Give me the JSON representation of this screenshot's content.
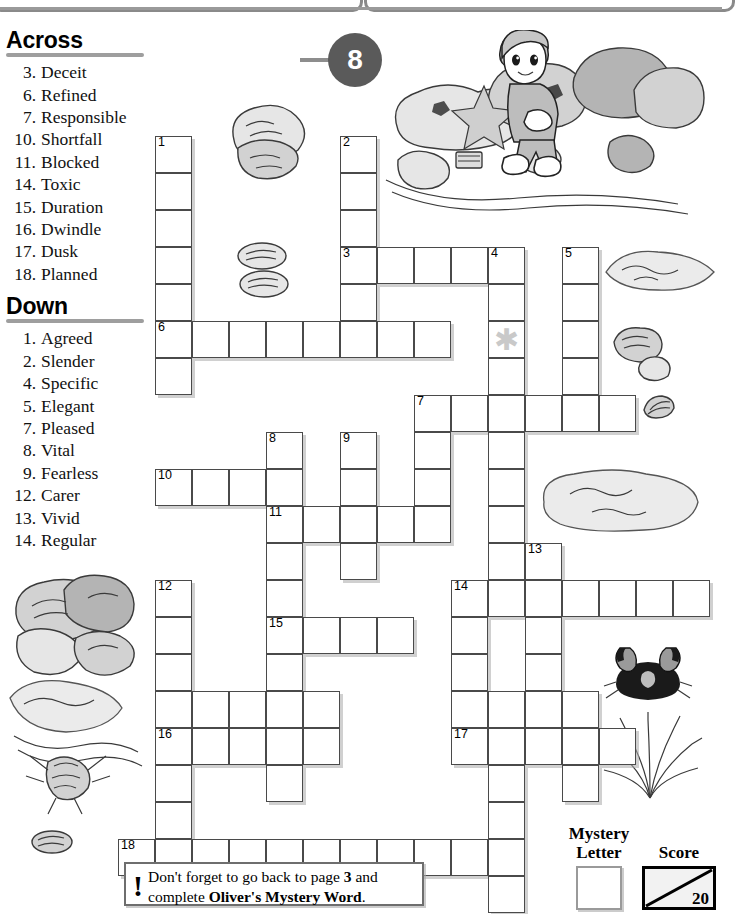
{
  "page": {
    "number": "8"
  },
  "clues": {
    "across_heading": "Across",
    "down_heading": "Down",
    "across": [
      {
        "num": "3.",
        "word": "Deceit"
      },
      {
        "num": "6.",
        "word": "Refined"
      },
      {
        "num": "7.",
        "word": "Responsible"
      },
      {
        "num": "10.",
        "word": "Shortfall"
      },
      {
        "num": "11.",
        "word": "Blocked"
      },
      {
        "num": "14.",
        "word": "Toxic"
      },
      {
        "num": "15.",
        "word": "Duration"
      },
      {
        "num": "16.",
        "word": "Dwindle"
      },
      {
        "num": "17.",
        "word": "Dusk"
      },
      {
        "num": "18.",
        "word": "Planned"
      }
    ],
    "down": [
      {
        "num": "1.",
        "word": "Agreed"
      },
      {
        "num": "2.",
        "word": "Slender"
      },
      {
        "num": "4.",
        "word": "Specific"
      },
      {
        "num": "5.",
        "word": "Elegant"
      },
      {
        "num": "7.",
        "word": "Pleased"
      },
      {
        "num": "8.",
        "word": "Vital"
      },
      {
        "num": "9.",
        "word": "Fearless"
      },
      {
        "num": "12.",
        "word": "Carer"
      },
      {
        "num": "13.",
        "word": "Vivid"
      },
      {
        "num": "14.",
        "word": "Regular"
      }
    ]
  },
  "grid": {
    "cell_size": 37,
    "cells": [
      {
        "c": 1,
        "r": 0,
        "n": "1"
      },
      {
        "c": 1,
        "r": 1
      },
      {
        "c": 1,
        "r": 2
      },
      {
        "c": 1,
        "r": 3
      },
      {
        "c": 1,
        "r": 4
      },
      {
        "c": 1,
        "r": 5,
        "n": "6"
      },
      {
        "c": 1,
        "r": 6
      },
      {
        "c": 6,
        "r": 0,
        "n": "2"
      },
      {
        "c": 6,
        "r": 1
      },
      {
        "c": 6,
        "r": 2
      },
      {
        "c": 6,
        "r": 3,
        "n": "3"
      },
      {
        "c": 7,
        "r": 3
      },
      {
        "c": 8,
        "r": 3
      },
      {
        "c": 9,
        "r": 3
      },
      {
        "c": 10,
        "r": 3,
        "n": "4"
      },
      {
        "c": 12,
        "r": 3,
        "n": "5"
      },
      {
        "c": 6,
        "r": 4
      },
      {
        "c": 10,
        "r": 4
      },
      {
        "c": 12,
        "r": 4
      },
      {
        "c": 2,
        "r": 5
      },
      {
        "c": 3,
        "r": 5
      },
      {
        "c": 4,
        "r": 5
      },
      {
        "c": 5,
        "r": 5
      },
      {
        "c": 6,
        "r": 5
      },
      {
        "c": 7,
        "r": 5
      },
      {
        "c": 8,
        "r": 5
      },
      {
        "c": 10,
        "r": 5,
        "star": true
      },
      {
        "c": 12,
        "r": 5
      },
      {
        "c": 10,
        "r": 6
      },
      {
        "c": 12,
        "r": 6
      },
      {
        "c": 8,
        "r": 7,
        "n": "7"
      },
      {
        "c": 9,
        "r": 7
      },
      {
        "c": 10,
        "r": 7
      },
      {
        "c": 11,
        "r": 7
      },
      {
        "c": 12,
        "r": 7
      },
      {
        "c": 13,
        "r": 7
      },
      {
        "c": 8,
        "r": 8
      },
      {
        "c": 10,
        "r": 8
      },
      {
        "c": 4,
        "r": 8,
        "n": "8"
      },
      {
        "c": 6,
        "r": 8,
        "n": "9"
      },
      {
        "c": 1,
        "r": 9,
        "n": "10"
      },
      {
        "c": 2,
        "r": 9
      },
      {
        "c": 3,
        "r": 9
      },
      {
        "c": 4,
        "r": 9
      },
      {
        "c": 6,
        "r": 9
      },
      {
        "c": 8,
        "r": 9
      },
      {
        "c": 10,
        "r": 9
      },
      {
        "c": 4,
        "r": 10,
        "n": "11"
      },
      {
        "c": 5,
        "r": 10
      },
      {
        "c": 6,
        "r": 10
      },
      {
        "c": 7,
        "r": 10
      },
      {
        "c": 8,
        "r": 10
      },
      {
        "c": 10,
        "r": 10
      },
      {
        "c": 4,
        "r": 11
      },
      {
        "c": 6,
        "r": 11
      },
      {
        "c": 10,
        "r": 11
      },
      {
        "c": 11,
        "r": 11,
        "n": "13"
      },
      {
        "c": 1,
        "r": 12,
        "n": "12"
      },
      {
        "c": 4,
        "r": 12
      },
      {
        "c": 9,
        "r": 12,
        "n": "14"
      },
      {
        "c": 10,
        "r": 12
      },
      {
        "c": 11,
        "r": 12
      },
      {
        "c": 12,
        "r": 12
      },
      {
        "c": 13,
        "r": 12
      },
      {
        "c": 14,
        "r": 12
      },
      {
        "c": 15,
        "r": 12
      },
      {
        "c": 1,
        "r": 13
      },
      {
        "c": 4,
        "r": 13,
        "n": "15"
      },
      {
        "c": 5,
        "r": 13
      },
      {
        "c": 6,
        "r": 13
      },
      {
        "c": 7,
        "r": 13
      },
      {
        "c": 9,
        "r": 13
      },
      {
        "c": 11,
        "r": 13
      },
      {
        "c": 1,
        "r": 14
      },
      {
        "c": 4,
        "r": 14
      },
      {
        "c": 9,
        "r": 14
      },
      {
        "c": 11,
        "r": 14
      },
      {
        "c": 1,
        "r": 15
      },
      {
        "c": 2,
        "r": 15
      },
      {
        "c": 3,
        "r": 15
      },
      {
        "c": 4,
        "r": 15
      },
      {
        "c": 5,
        "r": 15
      },
      {
        "c": 9,
        "r": 15
      },
      {
        "c": 10,
        "r": 15
      },
      {
        "c": 11,
        "r": 15
      },
      {
        "c": 12,
        "r": 15
      },
      {
        "c": 1,
        "r": 16,
        "n": "16"
      },
      {
        "c": 2,
        "r": 16
      },
      {
        "c": 3,
        "r": 16
      },
      {
        "c": 4,
        "r": 16
      },
      {
        "c": 5,
        "r": 16
      },
      {
        "c": 9,
        "r": 16,
        "n": "17"
      },
      {
        "c": 10,
        "r": 16
      },
      {
        "c": 11,
        "r": 16
      },
      {
        "c": 12,
        "r": 16
      },
      {
        "c": 13,
        "r": 16
      },
      {
        "c": 1,
        "r": 17
      },
      {
        "c": 4,
        "r": 17
      },
      {
        "c": 10,
        "r": 17
      },
      {
        "c": 12,
        "r": 17
      },
      {
        "c": 1,
        "r": 18
      },
      {
        "c": 10,
        "r": 18
      },
      {
        "c": 0,
        "r": 19,
        "n": "18"
      },
      {
        "c": 1,
        "r": 19
      },
      {
        "c": 2,
        "r": 19
      },
      {
        "c": 3,
        "r": 19
      },
      {
        "c": 4,
        "r": 19
      },
      {
        "c": 5,
        "r": 19
      },
      {
        "c": 6,
        "r": 19
      },
      {
        "c": 7,
        "r": 19
      },
      {
        "c": 8,
        "r": 19
      },
      {
        "c": 9,
        "r": 19
      },
      {
        "c": 10,
        "r": 19
      },
      {
        "c": 10,
        "r": 20
      }
    ]
  },
  "note": {
    "line1_pre": "Don't forget to go back to page ",
    "line1_bold": "3",
    "line1_post": " and",
    "line2_pre": "complete ",
    "line2_bold": "Oliver's Mystery Word",
    "line2_post": "."
  },
  "mystery": {
    "label_line1": "Mystery",
    "label_line2": "Letter",
    "value": ""
  },
  "score": {
    "label": "Score",
    "value": "20"
  }
}
